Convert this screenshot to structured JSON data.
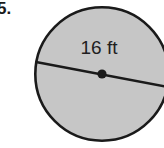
{
  "figure": {
    "problem_number": "5.",
    "shape": "circle",
    "dimension_label": "16 ft",
    "dimension_value": 16,
    "dimension_unit": "ft",
    "dimension_type": "diameter",
    "has_center_dot": true,
    "has_diameter_line": true,
    "colors": {
      "fill": "#c6c6c6",
      "stroke": "#1a1a1a",
      "background": "#ffffff",
      "text": "#1f1f1f"
    },
    "geometry": {
      "center_x": 102,
      "center_y": 74,
      "radius": 68,
      "stroke_width": 2.6,
      "center_dot_radius": 4.6,
      "diameter_line_x1": 36,
      "diameter_line_y1": 62,
      "diameter_line_x2": 168,
      "diameter_line_y2": 87
    }
  }
}
